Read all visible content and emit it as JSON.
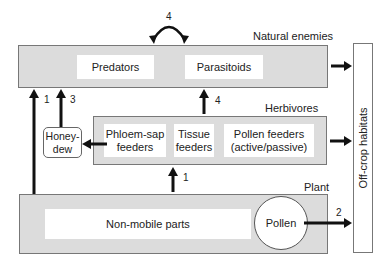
{
  "levels": {
    "natural_enemies": {
      "title": "Natural enemies",
      "items": [
        "Predators",
        "Parasitoids"
      ]
    },
    "herbivores": {
      "title": "Herbivores",
      "items": [
        "Phloem-sap\nfeeders",
        "Tissue\nfeeders",
        "Pollen feeders\n(active/passive)"
      ]
    },
    "plant": {
      "title": "Plant",
      "items": [
        "Non-mobile parts",
        "Pollen"
      ]
    }
  },
  "honeydew": {
    "label": "Honey-\ndew"
  },
  "off_crop": {
    "label": "Off-crop habitats"
  },
  "arrows": {
    "enemies_interaction": "4",
    "plant_to_enemies": "1",
    "honeydew_to_enemies": "3",
    "herbivores_to_enemies": "4",
    "plant_to_herbivores": "1",
    "pollen_to_offcrop": "2"
  },
  "colors": {
    "box_fill": "#dcdcdc",
    "box_border": "#777777",
    "arrow": "#111111"
  }
}
